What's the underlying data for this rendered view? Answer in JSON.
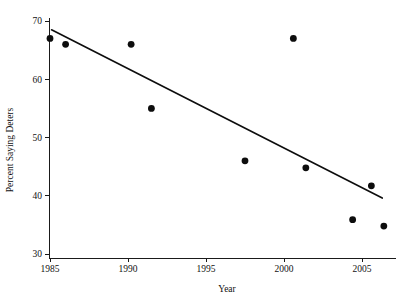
{
  "chart_data": {
    "type": "scatter",
    "title": "",
    "xlabel": "Year",
    "ylabel": "Percent Saying Deters",
    "xlim": [
      1984.2,
      2007.0
    ],
    "ylim": [
      29.0,
      70.6
    ],
    "xticks": [
      1985,
      1990,
      1995,
      2000,
      2005
    ],
    "xtick_labels": [
      "1985",
      "1990",
      "1995",
      "2000",
      "2005"
    ],
    "yticks": [
      30,
      40,
      50,
      60,
      70
    ],
    "ytick_labels": [
      "30",
      "40",
      "50",
      "60",
      "70"
    ],
    "grid": false,
    "legend": null,
    "marker": "filled-circle",
    "marker_color": "#0d0d0d",
    "points": [
      {
        "x": 1985.0,
        "y": 67.0
      },
      {
        "x": 1986.0,
        "y": 66.0
      },
      {
        "x": 1990.2,
        "y": 66.0
      },
      {
        "x": 1991.5,
        "y": 55.0
      },
      {
        "x": 1997.5,
        "y": 46.0
      },
      {
        "x": 2000.6,
        "y": 67.0
      },
      {
        "x": 2001.4,
        "y": 44.8
      },
      {
        "x": 2004.4,
        "y": 35.9
      },
      {
        "x": 2005.6,
        "y": 41.7
      },
      {
        "x": 2006.4,
        "y": 34.8
      }
    ],
    "series": [
      {
        "name": "Percent Saying Deters",
        "x": [
          1985.0,
          1986.0,
          1990.2,
          1991.5,
          1997.5,
          2000.6,
          2001.4,
          2004.4,
          2005.6,
          2006.4
        ],
        "values": [
          67.0,
          66.0,
          66.0,
          55.0,
          46.0,
          67.0,
          44.8,
          35.9,
          41.7,
          34.8
        ]
      }
    ],
    "trend_line": {
      "type": "linear-fit",
      "color": "#0d0d0d",
      "x_start": 1985.1,
      "y_start": 68.5,
      "x_end": 2006.3,
      "y_end": 39.6
    }
  }
}
